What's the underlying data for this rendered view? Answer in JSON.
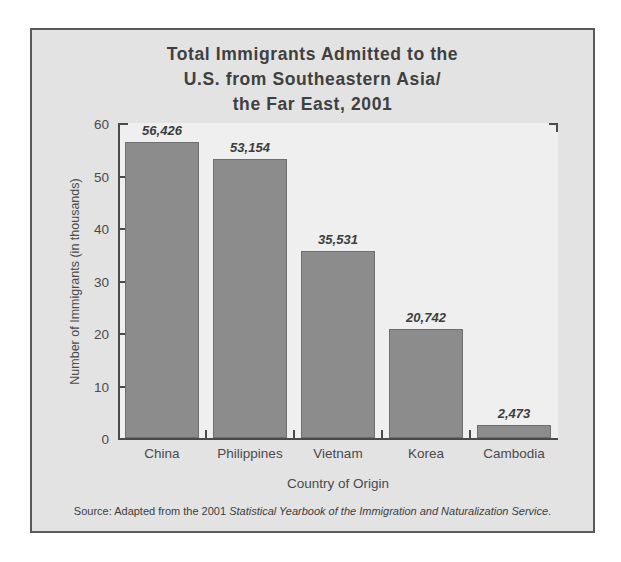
{
  "figure": {
    "title_lines": [
      "Total Immigrants Admitted to the",
      "U.S. from Southeastern Asia/",
      "the Far East, 2001"
    ],
    "source_prefix": "Source: Adapted from the 2001 ",
    "source_italic": "Statistical Yearbook of the Immigration and Naturalization Service",
    "source_suffix": "."
  },
  "colors": {
    "bar_fill": "#8c8c8c",
    "bar_stroke": "#6e6e6e",
    "plot_background": "#efefef",
    "panel_background": "#e3e3e3",
    "frame_border": "#595959",
    "axis_line": "#4a4a4a",
    "text": "#404040"
  },
  "chart_data": {
    "type": "bar",
    "xlabel": "Country of Origin",
    "ylabel": "Number of Immigrants (in thousands)",
    "categories": [
      "China",
      "Philippines",
      "Vietnam",
      "Korea",
      "Cambodia"
    ],
    "values": [
      56.426,
      53.154,
      35.531,
      20.742,
      2.473
    ],
    "value_labels": [
      "56,426",
      "53,154",
      "35,531",
      "20,742",
      "2,473"
    ],
    "ylim": [
      0,
      60
    ],
    "yticks": [
      0,
      10,
      20,
      30,
      40,
      50,
      60
    ],
    "ytick_labels": [
      "0",
      "10",
      "20",
      "30",
      "40",
      "50",
      "60"
    ],
    "grid": false,
    "legend": "none"
  }
}
